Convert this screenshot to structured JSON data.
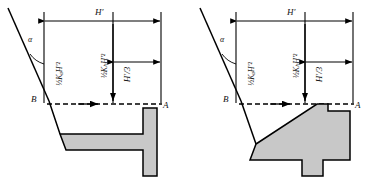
{
  "figure": {
    "type": "engineering-diagram",
    "background_color": "#ffffff",
    "line_color": "#000000",
    "fill_color": "#c8c8c8",
    "panels": [
      {
        "id": "left",
        "wall_type": "cantilever-retaining-wall",
        "labels": {
          "angle": "α",
          "point_top": "B",
          "point_right": "A",
          "dimension_total": "H′",
          "dimension_third": "H′/3",
          "force_horizontal": "½KₐH′²",
          "force_vertical": "½KₕH′²"
        }
      },
      {
        "id": "right",
        "wall_type": "gravity-retaining-wall",
        "labels": {
          "angle": "α",
          "point_top": "B",
          "point_right": "A",
          "dimension_total": "H′",
          "dimension_third": "H′/3",
          "force_horizontal": "½KₐH′²",
          "force_vertical": "½KₕH′²"
        }
      }
    ]
  }
}
